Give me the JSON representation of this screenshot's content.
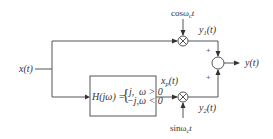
{
  "diagram": {
    "type": "block-diagram",
    "input": {
      "label": "x(t)"
    },
    "output": {
      "label": "y(t)"
    },
    "top_branch": {
      "carrier_label": "cosω",
      "carrier_sub": "c",
      "carrier_tail": "t",
      "multiplier_symbol": "×",
      "product_label": "y",
      "product_sub": "1",
      "product_tail": "(t)"
    },
    "bottom_branch": {
      "filter": {
        "lhs": "H(jω) =",
        "case1": "j,",
        "cond1": "ω > 0",
        "case2": "−j,",
        "cond2": "ω < 0"
      },
      "filter_output_label": "x",
      "filter_output_sub": "p",
      "filter_output_tail": "(t)",
      "carrier_label": "sinω",
      "carrier_sub": "c",
      "carrier_tail": "t",
      "multiplier_symbol": "×",
      "product_label": "y",
      "product_sub": "2",
      "product_tail": "(t)"
    },
    "adder": {
      "top_sign": "+",
      "bottom_sign": "+"
    },
    "colors": {
      "line": "#555555",
      "text": "#333333",
      "background": "#ffffff"
    }
  }
}
